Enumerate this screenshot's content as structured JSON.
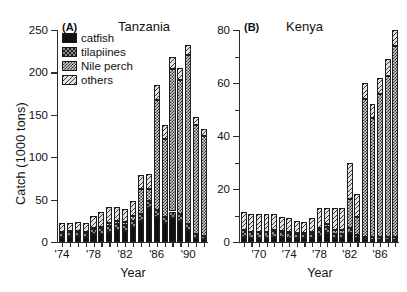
{
  "figure": {
    "background": "#ffffff",
    "ink": "#111111"
  },
  "legend": {
    "items": [
      {
        "label": "catfish",
        "key": "catfish",
        "pattern": "solid-black"
      },
      {
        "label": "tilapiines",
        "key": "tilapiines",
        "pattern": "dark-checker"
      },
      {
        "label": "Nile perch",
        "key": "nileperch",
        "pattern": "light-checker"
      },
      {
        "label": "others",
        "key": "others",
        "pattern": "diagonal-hatch"
      }
    ]
  },
  "chart_data": [
    {
      "type": "bar",
      "panel_tag": "(A)",
      "title": "Tanzania",
      "xlabel": "Year",
      "ylabel": "Catch (1000 tons)",
      "ylim": [
        0,
        250
      ],
      "yticks": [
        0,
        50,
        100,
        150,
        200,
        250
      ],
      "yticklabels": [
        "0",
        "50",
        "100",
        "150",
        "200",
        "250"
      ],
      "grid": false,
      "stacked": true,
      "legend_position": "upper-left",
      "categories": [
        1974,
        1975,
        1976,
        1977,
        1978,
        1979,
        1980,
        1981,
        1982,
        1983,
        1984,
        1985,
        1986,
        1987,
        1988,
        1989,
        1990,
        1991,
        1992
      ],
      "xticks": [
        1974,
        1978,
        1982,
        1986,
        1990
      ],
      "xticklabels": [
        "'74",
        "'78",
        "'82",
        "'86",
        "'90"
      ],
      "series": [
        {
          "name": "catfish",
          "values": [
            6,
            7,
            7,
            6,
            9,
            10,
            12,
            14,
            13,
            18,
            25,
            40,
            30,
            22,
            28,
            25,
            14,
            5,
            3
          ]
        },
        {
          "name": "tilapiines",
          "values": [
            5,
            5,
            5,
            5,
            6,
            6,
            7,
            7,
            7,
            7,
            8,
            8,
            8,
            8,
            8,
            8,
            7,
            5,
            4
          ]
        },
        {
          "name": "nileperch",
          "values": [
            1,
            1,
            1,
            1,
            2,
            2,
            3,
            4,
            4,
            6,
            30,
            15,
            130,
            92,
            168,
            158,
            200,
            128,
            118
          ]
        },
        {
          "name": "others",
          "values": [
            10,
            10,
            11,
            11,
            14,
            17,
            19,
            16,
            15,
            17,
            16,
            17,
            17,
            16,
            14,
            14,
            11,
            9,
            8
          ]
        }
      ],
      "totals": [
        22,
        23,
        24,
        23,
        31,
        35,
        41,
        41,
        39,
        48,
        79,
        80,
        185,
        138,
        218,
        205,
        232,
        147,
        133
      ]
    },
    {
      "type": "bar",
      "panel_tag": "(B)",
      "title": "Kenya",
      "xlabel": "Year",
      "ylabel": "",
      "ylim": [
        0,
        80
      ],
      "yticks": [
        0,
        20,
        40,
        60,
        80
      ],
      "yticklabels": [
        "0",
        "20",
        "40",
        "60",
        "80"
      ],
      "grid": false,
      "stacked": true,
      "legend_position": "none",
      "categories": [
        1968,
        1969,
        1970,
        1971,
        1972,
        1973,
        1974,
        1975,
        1976,
        1977,
        1978,
        1979,
        1980,
        1981,
        1982,
        1983,
        1984,
        1985,
        1986,
        1987,
        1988
      ],
      "xticks": [
        1970,
        1974,
        1978,
        1982,
        1986
      ],
      "xticklabels": [
        "'70",
        "'74",
        "'78",
        "'82",
        "'86"
      ],
      "series": [
        {
          "name": "catfish",
          "values": [
            2.0,
            1.6,
            1.6,
            1.6,
            2.0,
            1.8,
            1.6,
            1.5,
            1.4,
            1.4,
            2.2,
            3.4,
            1.4,
            1.4,
            3.4,
            1.4,
            1.0,
            0.8,
            0.8,
            0.8,
            0.8
          ]
        },
        {
          "name": "tilapiines",
          "values": [
            2.4,
            2.0,
            2.0,
            2.0,
            2.2,
            2.0,
            1.8,
            1.6,
            1.6,
            1.8,
            2.4,
            2.4,
            1.8,
            1.6,
            1.8,
            1.2,
            1.0,
            1.0,
            1.0,
            1.0,
            1.0
          ]
        },
        {
          "name": "nileperch",
          "values": [
            0.3,
            0.3,
            0.3,
            0.3,
            0.3,
            0.3,
            0.3,
            0.3,
            0.3,
            0.4,
            0.6,
            1.0,
            1.2,
            1.4,
            11.0,
            7.0,
            52.0,
            45.0,
            54.0,
            61.0,
            72.0
          ]
        },
        {
          "name": "others",
          "values": [
            6.8,
            6.6,
            6.6,
            6.6,
            6.0,
            5.4,
            5.2,
            4.6,
            4.2,
            5.4,
            7.8,
            6.2,
            8.6,
            8.6,
            13.8,
            8.4,
            6.0,
            5.2,
            6.2,
            6.2,
            6.2
          ]
        }
      ],
      "totals": [
        11.5,
        10.5,
        10.5,
        10.5,
        10.5,
        9.5,
        8.9,
        8.0,
        7.5,
        9.0,
        13.0,
        13.0,
        13.0,
        13.0,
        30.0,
        18.0,
        60.0,
        52.0,
        62.0,
        69.0,
        80.0
      ]
    }
  ]
}
